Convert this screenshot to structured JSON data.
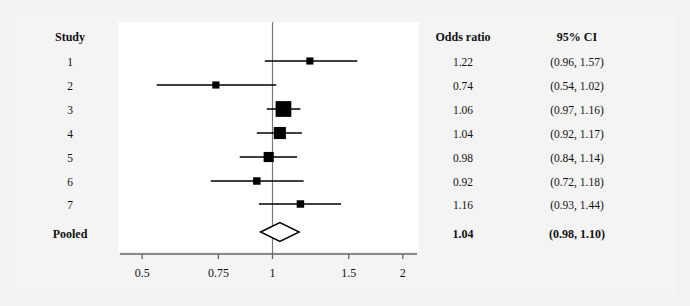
{
  "figure": {
    "background_color": "#f2f2f2",
    "panel_color": "#ffffff",
    "ink_color": "#000000"
  },
  "columns": {
    "study_header": "Study",
    "odds_ratio_header": "Odds ratio",
    "ci_header": "95% CI"
  },
  "chart_data": {
    "type": "forest",
    "title": "",
    "xlabel": "",
    "ylabel": "",
    "x_scale": "log",
    "xlim": [
      0.45,
      2.25
    ],
    "grid": false,
    "legend": "none",
    "reference_line": 1,
    "effect_measure": "Odds ratio",
    "ci_level": "95% CI",
    "xticks": [
      0.5,
      0.75,
      1,
      1.5,
      2
    ],
    "xtick_labels": [
      "0.5",
      "0.75",
      "1",
      "1.5",
      "2"
    ],
    "studies": [
      {
        "label": "1",
        "estimate": 1.22,
        "ci_low": 0.96,
        "ci_high": 1.57,
        "estimate_text": "1.22",
        "ci_text": "(0.96, 1.57)",
        "weight": 0.1,
        "marker": "square"
      },
      {
        "label": "2",
        "estimate": 0.74,
        "ci_low": 0.54,
        "ci_high": 1.02,
        "estimate_text": "0.74",
        "ci_text": "(0.54, 1.02)",
        "weight": 0.1,
        "marker": "square"
      },
      {
        "label": "3",
        "estimate": 1.06,
        "ci_low": 0.97,
        "ci_high": 1.16,
        "estimate_text": "1.06",
        "ci_text": "(0.97, 1.16)",
        "weight": 0.62,
        "marker": "square"
      },
      {
        "label": "4",
        "estimate": 1.04,
        "ci_low": 0.92,
        "ci_high": 1.17,
        "estimate_text": "1.04",
        "ci_text": "(0.92, 1.17)",
        "weight": 0.4,
        "marker": "square"
      },
      {
        "label": "5",
        "estimate": 0.98,
        "ci_low": 0.84,
        "ci_high": 1.14,
        "estimate_text": "0.98",
        "ci_text": "(0.84, 1.14)",
        "weight": 0.28,
        "marker": "square"
      },
      {
        "label": "6",
        "estimate": 0.92,
        "ci_low": 0.72,
        "ci_high": 1.18,
        "estimate_text": "0.92",
        "ci_text": "(0.72, 1.18)",
        "weight": 0.12,
        "marker": "square"
      },
      {
        "label": "7",
        "estimate": 1.16,
        "ci_low": 0.93,
        "ci_high": 1.44,
        "estimate_text": "1.16",
        "ci_text": "(0.93, 1.44)",
        "weight": 0.12,
        "marker": "square"
      }
    ],
    "pooled": {
      "label": "Pooled",
      "estimate": 1.04,
      "ci_low": 0.98,
      "ci_high": 1.1,
      "estimate_text": "1.04",
      "ci_text": "(0.98, 1.10)",
      "marker": "diamond"
    }
  }
}
